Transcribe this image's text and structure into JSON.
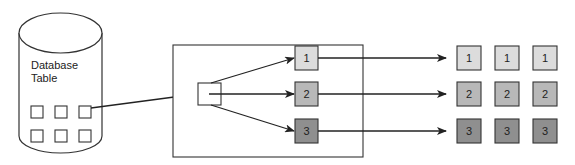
{
  "database": {
    "label_line1": "Database",
    "label_line2": "Table"
  },
  "partitions": [
    {
      "label": "1",
      "fill": "#dcdcdc"
    },
    {
      "label": "2",
      "fill": "#b8b8b8"
    },
    {
      "label": "3",
      "fill": "#8f8f8f"
    }
  ],
  "outputs": [
    [
      "1",
      "1",
      "1"
    ],
    [
      "2",
      "2",
      "2"
    ],
    [
      "3",
      "3",
      "3"
    ]
  ],
  "colors": {
    "stroke": "#333333",
    "row1": "#dcdcdc",
    "row2": "#b8b8b8",
    "row3": "#8f8f8f"
  }
}
